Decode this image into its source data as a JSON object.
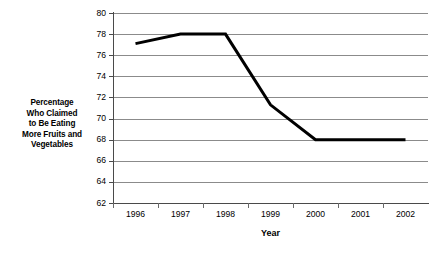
{
  "chart_data": {
    "type": "line",
    "title": "",
    "xlabel": "Year",
    "ylabel": "Percentage Who Claimed to Be Eating More Fruits and Vegetables",
    "ylabel_lines": [
      "Percentage",
      "Who Claimed",
      "to Be Eating",
      "More Fruits and",
      "Vegetables"
    ],
    "categories": [
      "1996",
      "1997",
      "1998",
      "1999",
      "2000",
      "2001",
      "2002"
    ],
    "values": [
      77.1,
      78,
      78,
      71.3,
      68,
      68,
      68
    ],
    "series": [
      {
        "name": "Percentage who claimed to be eating more fruits and vegetables",
        "values": [
          77.1,
          78,
          78,
          71.3,
          68,
          68,
          68
        ]
      }
    ],
    "ylim": [
      62,
      80
    ],
    "ytick_values": [
      80,
      78,
      76,
      74,
      72,
      70,
      68,
      66,
      64,
      62
    ],
    "ytick_labels": [
      "80",
      "78",
      "76",
      "74",
      "72",
      "70",
      "68",
      "66",
      "64",
      "62"
    ],
    "ystep": 2,
    "grid": true,
    "grid_axis": "y",
    "legend": false,
    "legend_position": "none",
    "line_color": "#000000",
    "grid_color": "#8b8b8b",
    "axis_color": "#4a4a4a",
    "background_color": "#ffffff",
    "line_width": 3,
    "markers": false
  }
}
